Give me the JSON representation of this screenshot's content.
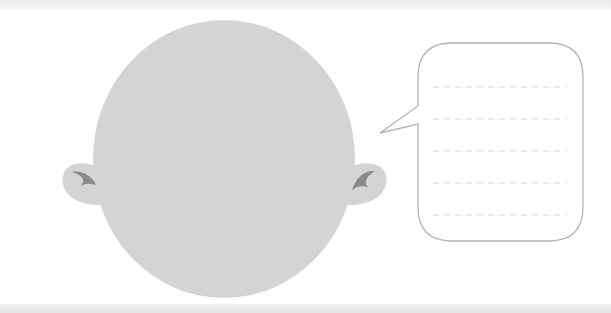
{
  "illustration": {
    "type": "worksheet-template",
    "elements": {
      "head": {
        "shape": "circle",
        "fill": "#d4d4d4",
        "cx": 224,
        "cy": 159,
        "rx": 131,
        "ry": 139
      },
      "left_ear": {
        "fill": "#d4d4d4",
        "curl_color": "#8a8a8a"
      },
      "right_ear": {
        "fill": "#d4d4d4",
        "curl_color": "#8a8a8a"
      },
      "speech_bubble": {
        "x": 418,
        "y": 43,
        "width": 165,
        "height": 198,
        "radius": 34,
        "stroke": "#b3b3b3",
        "fill": "#ffffff",
        "tail_tip": [
          380,
          133
        ],
        "writing_lines": 5,
        "line_color": "#d6d6d6"
      }
    },
    "colors": {
      "background": "#ffffff",
      "band": "#ececec",
      "head": "#d4d4d4",
      "ear_curl": "#8a8a8a",
      "bubble_outline": "#b3b3b3",
      "dashed_line": "#d6d6d6"
    }
  }
}
